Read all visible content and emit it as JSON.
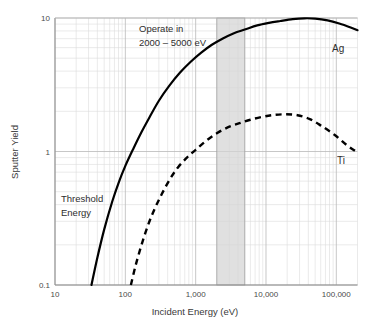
{
  "chart_data": {
    "type": "line",
    "title": "",
    "xlabel": "Incident Energy (eV)",
    "ylabel": "Sputter Yield",
    "xscale": "log",
    "yscale": "log",
    "xlim": [
      10,
      200000
    ],
    "ylim": [
      0.1,
      10
    ],
    "grid": true,
    "legend_position": "inline-right",
    "xticks": [
      {
        "value": 10,
        "label": "10"
      },
      {
        "value": 100,
        "label": "100"
      },
      {
        "value": 1000,
        "label": "1,000"
      },
      {
        "value": 10000,
        "label": "10,000"
      },
      {
        "value": 100000,
        "label": "100,000"
      }
    ],
    "yticks": [
      {
        "value": 0.1,
        "label": "0.1"
      },
      {
        "value": 1,
        "label": "1"
      },
      {
        "value": 10,
        "label": "10"
      }
    ],
    "series": [
      {
        "name": "Ag",
        "style": "solid",
        "label": "Ag",
        "points": [
          [
            33,
            0.1
          ],
          [
            40,
            0.16
          ],
          [
            50,
            0.26
          ],
          [
            65,
            0.42
          ],
          [
            80,
            0.58
          ],
          [
            100,
            0.78
          ],
          [
            130,
            1.05
          ],
          [
            170,
            1.4
          ],
          [
            220,
            1.8
          ],
          [
            300,
            2.4
          ],
          [
            420,
            3.1
          ],
          [
            600,
            3.9
          ],
          [
            850,
            4.7
          ],
          [
            1200,
            5.5
          ],
          [
            1700,
            6.3
          ],
          [
            2400,
            7.0
          ],
          [
            3500,
            7.7
          ],
          [
            5000,
            8.2
          ],
          [
            7500,
            8.8
          ],
          [
            11000,
            9.2
          ],
          [
            16000,
            9.5
          ],
          [
            24000,
            9.8
          ],
          [
            35000,
            9.95
          ],
          [
            50000,
            9.9
          ],
          [
            75000,
            9.6
          ],
          [
            110000,
            9.1
          ],
          [
            160000,
            8.5
          ],
          [
            200000,
            8.1
          ]
        ]
      },
      {
        "name": "Ti",
        "style": "dashed",
        "label": "Ti",
        "points": [
          [
            120,
            0.1
          ],
          [
            140,
            0.14
          ],
          [
            170,
            0.2
          ],
          [
            210,
            0.28
          ],
          [
            260,
            0.37
          ],
          [
            330,
            0.48
          ],
          [
            430,
            0.62
          ],
          [
            560,
            0.76
          ],
          [
            750,
            0.9
          ],
          [
            1000,
            1.03
          ],
          [
            1400,
            1.2
          ],
          [
            2000,
            1.37
          ],
          [
            2900,
            1.52
          ],
          [
            4200,
            1.63
          ],
          [
            6000,
            1.73
          ],
          [
            9000,
            1.82
          ],
          [
            13000,
            1.88
          ],
          [
            19000,
            1.9
          ],
          [
            28000,
            1.87
          ],
          [
            42000,
            1.75
          ],
          [
            62000,
            1.55
          ],
          [
            95000,
            1.33
          ],
          [
            140000,
            1.12
          ],
          [
            190000,
            1.0
          ]
        ]
      }
    ],
    "shaded_band": {
      "label": "Operate in 2000 – 5000 eV",
      "x_start": 2000,
      "x_end": 5000,
      "color": "#d4d4d4"
    },
    "annotations": [
      {
        "name": "operate-note",
        "line1": "Operate in",
        "line2": "2000 – 5000 eV"
      },
      {
        "name": "threshold-note",
        "line1": "Threshold",
        "line2": "Energy"
      }
    ]
  },
  "labels": {
    "ylabel": "Sputter Yield",
    "xlabel": "Incident Energy (eV)",
    "ag": "Ag",
    "ti": "Ti",
    "operate_line1": "Operate in",
    "operate_line2": "2000 – 5000 eV",
    "threshold_line1": "Threshold",
    "threshold_line2": "Energy",
    "xtick_1": "10",
    "xtick_2": "100",
    "xtick_3": "1,000",
    "xtick_4": "10,000",
    "xtick_5": "100,000",
    "ytick_1": "0.1",
    "ytick_2": "1",
    "ytick_3": "10"
  }
}
